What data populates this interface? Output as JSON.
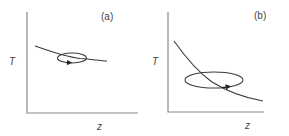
{
  "figure": {
    "panels": [
      {
        "id": "a",
        "label": "(a)",
        "ylabel": "T",
        "xlabel": "z",
        "description": "Gently decreasing T(z) curve with a small closed circulation loop (ellipse) centered on the curve, arrow indicating rightward motion along the bottom of the loop"
      },
      {
        "id": "b",
        "label": "(b)",
        "ylabel": "T",
        "xlabel": "z",
        "description": "Steeply decreasing T(z) curve with a larger closed circulation loop (ellipse) crossing the curve, arrow indicating rightward motion along the bottom of the loop"
      }
    ]
  },
  "colors": {
    "axis": "#8a8a8a",
    "curve": "#3a3a3a",
    "text": "#444444",
    "background": "#ffffff"
  }
}
